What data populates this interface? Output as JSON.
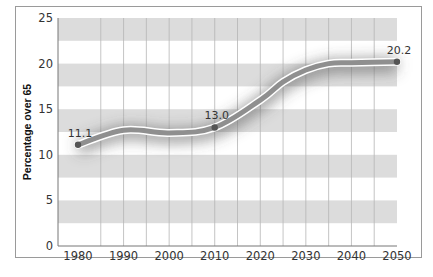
{
  "chart_data": {
    "type": "line",
    "title": "",
    "xlabel": "",
    "ylabel": "Percentage over 65",
    "x": [
      1980,
      1990,
      2000,
      2010,
      2020,
      2025,
      2030,
      2035,
      2040,
      2050
    ],
    "series": [
      {
        "name": "Percentage over 65",
        "values": [
          11.1,
          12.7,
          12.4,
          13.0,
          16.0,
          18.0,
          19.3,
          20.0,
          20.1,
          20.2
        ]
      }
    ],
    "labeled_points": [
      {
        "x": 1980,
        "y": 11.1,
        "label": "11.1"
      },
      {
        "x": 2010,
        "y": 13.0,
        "label": "13.0"
      },
      {
        "x": 2050,
        "y": 20.2,
        "label": "20.2"
      }
    ],
    "xticks": [
      "1980",
      "1990",
      "2000",
      "2010",
      "2020",
      "2030",
      "2040",
      "2050"
    ],
    "yticks": [
      "0",
      "5",
      "10",
      "15",
      "20",
      "25"
    ],
    "ylim": [
      0,
      25
    ],
    "xlim": [
      1975,
      2050
    ],
    "grid": true,
    "legend": null,
    "colors": {
      "line": "#8a8a8a",
      "line_outline": "#ffffff",
      "marker": "#555555",
      "stripe": "#dcdcdc",
      "gridline": "#b5b5b5"
    }
  }
}
